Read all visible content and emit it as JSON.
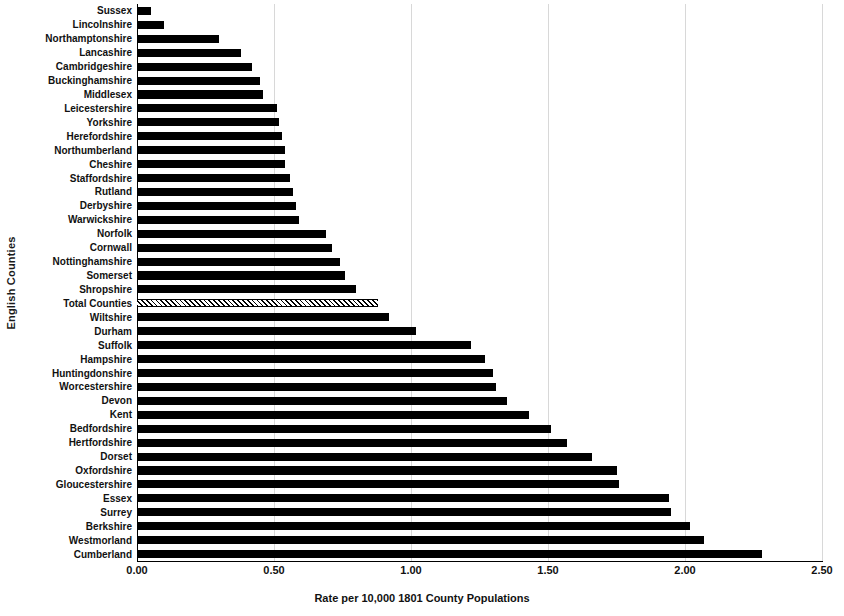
{
  "chart_data": {
    "type": "bar",
    "orientation": "horizontal",
    "title": "",
    "xlabel": "Rate per 10,000 1801 County Populations",
    "ylabel": "English Counties",
    "xlim": [
      0.0,
      2.5
    ],
    "xticks": [
      "0.00",
      "0.50",
      "1.00",
      "1.50",
      "2.00",
      "2.50"
    ],
    "xtick_values": [
      0.0,
      0.5,
      1.0,
      1.5,
      2.0,
      2.5
    ],
    "grid": true,
    "gridaxis": "x",
    "legend": "none",
    "bar_color": "#000000",
    "highlight_color": "#ffffff",
    "highlight_pattern": "cross-hatch",
    "highlight_category": "Total Counties",
    "categories": [
      "Sussex",
      "Lincolnshire",
      "Northamptonshire",
      "Lancashire",
      "Cambridgeshire",
      "Buckinghamshire",
      "Middlesex",
      "Leicestershire",
      "Yorkshire",
      "Herefordshire",
      "Northumberland",
      "Cheshire",
      "Staffordshire",
      "Rutland",
      "Derbyshire",
      "Warwickshire",
      "Norfolk",
      "Cornwall",
      "Nottinghamshire",
      "Somerset",
      "Shropshire",
      "Total Counties",
      "Wiltshire",
      "Durham",
      "Suffolk",
      "Hampshire",
      "Huntingdonshire",
      "Worcestershire",
      "Devon",
      "Kent",
      "Bedfordshire",
      "Hertfordshire",
      "Dorset",
      "Oxfordshire",
      "Gloucestershire",
      "Essex",
      "Surrey",
      "Berkshire",
      "Westmorland",
      "Cumberland"
    ],
    "values": [
      0.05,
      0.1,
      0.3,
      0.38,
      0.42,
      0.45,
      0.46,
      0.51,
      0.52,
      0.53,
      0.54,
      0.54,
      0.56,
      0.57,
      0.58,
      0.59,
      0.69,
      0.71,
      0.74,
      0.76,
      0.8,
      0.88,
      0.92,
      1.02,
      1.22,
      1.27,
      1.3,
      1.31,
      1.35,
      1.43,
      1.51,
      1.57,
      1.66,
      1.75,
      1.76,
      1.94,
      1.95,
      2.02,
      2.07,
      2.28
    ]
  }
}
